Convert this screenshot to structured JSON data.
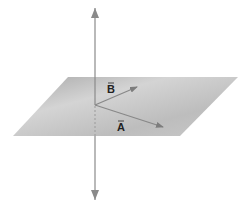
{
  "diagram": {
    "type": "3d-vectors-plane",
    "plane": {
      "corners": [
        [
          68,
          77
        ],
        [
          238,
          77
        ],
        [
          180,
          136
        ],
        [
          13,
          136
        ]
      ],
      "color_light": "#d2d2d2",
      "color_dark": "#a8a8a8"
    },
    "axis": {
      "x": 95,
      "y_top": 8,
      "y_bottom": 200,
      "color": "#8a8a8a"
    },
    "origin": [
      95,
      105
    ],
    "vectors": [
      {
        "name": "B",
        "label": "B",
        "tip": [
          137,
          87
        ],
        "label_pos": [
          108,
          93
        ],
        "color": "#888888"
      },
      {
        "name": "A",
        "label": "A",
        "tip": [
          163,
          127
        ],
        "label_pos": [
          118,
          131
        ],
        "color": "#888888"
      }
    ]
  }
}
